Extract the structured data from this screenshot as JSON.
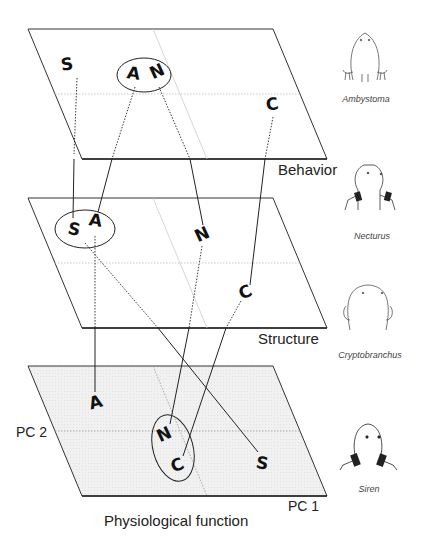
{
  "figure": {
    "planes": [
      {
        "id": "behavior",
        "label": "Behavior",
        "shaded": false
      },
      {
        "id": "structure",
        "label": "Structure",
        "shaded": false
      },
      {
        "id": "physiological",
        "label": "Physiological function",
        "shaded": true
      }
    ],
    "axes": {
      "x": "PC 1",
      "y": "PC 2"
    },
    "nodes": {
      "behavior": [
        {
          "letter": "S",
          "x": 68,
          "y": 66,
          "rot": -8
        },
        {
          "letter": "A",
          "x": 133,
          "y": 75,
          "rot": 8
        },
        {
          "letter": "N",
          "x": 157,
          "y": 73,
          "rot": -25
        },
        {
          "letter": "C",
          "x": 273,
          "y": 106,
          "rot": -10
        }
      ],
      "structure": [
        {
          "letter": "S",
          "x": 75,
          "y": 231,
          "rot": 12
        },
        {
          "letter": "A",
          "x": 96,
          "y": 222,
          "rot": 8
        },
        {
          "letter": "N",
          "x": 202,
          "y": 234,
          "rot": -25
        },
        {
          "letter": "C",
          "x": 246,
          "y": 292,
          "rot": -25
        }
      ],
      "physiological": [
        {
          "letter": "A",
          "x": 95,
          "y": 403,
          "rot": -15
        },
        {
          "letter": "N",
          "x": 163,
          "y": 434,
          "rot": -25
        },
        {
          "letter": "C",
          "x": 178,
          "y": 466,
          "rot": -25
        },
        {
          "letter": "S",
          "x": 263,
          "y": 463,
          "rot": 10
        }
      ]
    },
    "groupings": [
      {
        "plane": "behavior",
        "members": [
          "A",
          "N"
        ]
      },
      {
        "plane": "structure",
        "members": [
          "S",
          "A"
        ]
      },
      {
        "plane": "physiological",
        "members": [
          "N",
          "C"
        ]
      }
    ],
    "connections": [
      {
        "species": "S",
        "from": "behavior",
        "to": "structure",
        "style": "dotted"
      },
      {
        "species": "A",
        "from": "behavior",
        "to": "structure",
        "style": "dotted-solid"
      },
      {
        "species": "N",
        "from": "behavior",
        "to": "structure",
        "style": "dotted-solid"
      },
      {
        "species": "C",
        "from": "behavior",
        "to": "structure",
        "style": "dotted-solid"
      },
      {
        "species": "A",
        "from": "structure",
        "to": "physiological",
        "style": "dotted-solid"
      },
      {
        "species": "N",
        "from": "structure",
        "to": "physiological",
        "style": "dotted-solid"
      },
      {
        "species": "C",
        "from": "structure",
        "to": "physiological",
        "style": "dotted-solid"
      },
      {
        "species": "S",
        "from": "structure",
        "to": "physiological",
        "style": "dotted-solid"
      }
    ],
    "species": [
      {
        "name": "Ambystoma",
        "code": "A"
      },
      {
        "name": "Necturus",
        "code": "N"
      },
      {
        "name": "Cryptobranchus",
        "code": "C"
      },
      {
        "name": "Siren",
        "code": "S"
      }
    ]
  }
}
